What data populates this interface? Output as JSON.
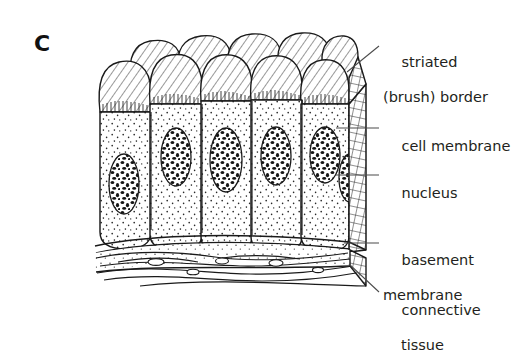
{
  "figure": {
    "panel_letter": "C",
    "title_alt": "Simple columnar epithelium with striated (brush) border",
    "background_color": "#ffffff",
    "ink_color": "#231f20",
    "labels": [
      {
        "id": "striated-border",
        "line1": "striated",
        "line2": "(brush) border",
        "leader": "diagonal",
        "points_to": "apical brush border at top of columnar cells"
      },
      {
        "id": "cell-membrane",
        "line1": "cell membrane",
        "line2": "",
        "leader": "horizontal",
        "points_to": "lateral border between adjacent columnar cells"
      },
      {
        "id": "nucleus",
        "line1": "nucleus",
        "line2": "",
        "leader": "horizontal",
        "points_to": "oval nucleus inside a columnar cell"
      },
      {
        "id": "basement-membrane",
        "line1": "basement",
        "line2": "membrane",
        "leader": "horizontal",
        "points_to": "thin layer beneath the epithelial cells"
      },
      {
        "id": "connective-tissue",
        "line1": "connective",
        "line2": "tissue",
        "leader": "diagonal",
        "points_to": "wavy fibrous layer below basement membrane"
      }
    ],
    "structures": {
      "front_cell_count": 6,
      "back_cell_count": 6,
      "cut_face": "cross-hatched right side showing tissue depth",
      "cytoplasm_texture": "fine stipple",
      "brush_border_texture": "short vertical striations",
      "nucleus_texture": "coarse dark chromatin blotches",
      "connective_tissue_texture": "wavy overlapping spindle cells"
    }
  }
}
